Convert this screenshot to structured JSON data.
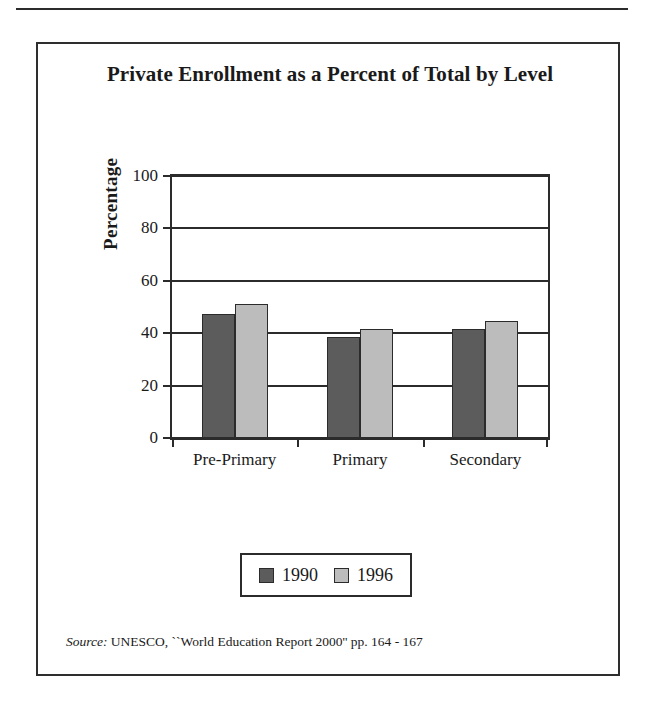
{
  "figure": {
    "title": "Private Enrollment as a Percent of Total by Level",
    "source_prefix": "Source:",
    "source_text": "UNESCO, ``World Education Report 2000'' pp. 164 - 167"
  },
  "chart_data": {
    "type": "bar",
    "title": "Private Enrollment as a Percent of Total by Level",
    "xlabel": "",
    "ylabel": "Percentage",
    "categories": [
      "Pre-Primary",
      "Primary",
      "Secondary"
    ],
    "series": [
      {
        "name": "1990",
        "color": "#5c5c5c",
        "values": [
          47.5,
          38.5,
          41.5
        ]
      },
      {
        "name": "1996",
        "color": "#bcbcbc",
        "values": [
          51,
          41.5,
          44.5
        ]
      }
    ],
    "ylim": [
      0,
      100
    ],
    "yticks": [
      0,
      20,
      40,
      60,
      80,
      100
    ],
    "ytick_labels": [
      "0",
      "20",
      "40",
      "60",
      "80",
      "100"
    ],
    "grid": true,
    "grid_axis": "y",
    "legend_position": "bottom-center",
    "legend_entries": [
      "1990",
      "1996"
    ]
  },
  "axis": {
    "y_title": "Percentage",
    "ticks": [
      {
        "value": 100,
        "label": "100"
      },
      {
        "value": 80,
        "label": "80"
      },
      {
        "value": 60,
        "label": "60"
      },
      {
        "value": 40,
        "label": "40"
      },
      {
        "value": 20,
        "label": "20"
      },
      {
        "value": 0,
        "label": "0"
      }
    ]
  },
  "legend": {
    "items": [
      {
        "label": "1990",
        "color": "#5c5c5c"
      },
      {
        "label": "1996",
        "color": "#bcbcbc"
      }
    ]
  },
  "colors": {
    "series_1990": "#5c5c5c",
    "series_1996": "#bcbcbc",
    "frame": "#2e2e2e",
    "text": "#1a1a1a"
  }
}
